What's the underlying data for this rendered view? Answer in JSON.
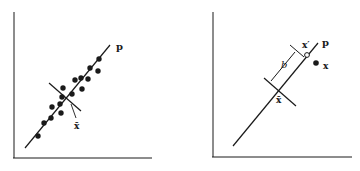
{
  "figure": {
    "panels": [
      {
        "id": "left",
        "description": "Data points scattered along principal axis p, with mean x-bar",
        "labels": {
          "axis_line": "p",
          "mean": "x̄"
        },
        "points": [
          [
            38,
            136
          ],
          [
            44,
            123
          ],
          [
            51,
            118
          ],
          [
            52,
            107
          ],
          [
            61,
            113
          ],
          [
            62,
            97
          ],
          [
            60,
            104
          ],
          [
            63,
            88
          ],
          [
            72,
            94
          ],
          [
            75,
            80
          ],
          [
            82,
            89
          ],
          [
            81,
            78
          ],
          [
            88,
            79
          ],
          [
            90,
            68
          ],
          [
            98,
            71
          ],
          [
            99,
            59
          ]
        ]
      },
      {
        "id": "right",
        "description": "Point x projected onto axis p at x', at distance b from mean x-bar",
        "labels": {
          "axis_line": "p",
          "mean": "x̄",
          "projection": "x′",
          "point": "x",
          "distance": "b"
        }
      }
    ],
    "colors": {
      "ink": "#1a1a1a",
      "background": "#ffffff"
    }
  }
}
